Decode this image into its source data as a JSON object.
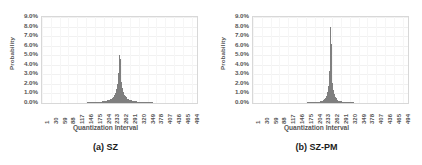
{
  "figure": {
    "panels": [
      {
        "caption": "(a) SZ",
        "xlabel": "Quantization Interval",
        "ylabel": "Probability"
      },
      {
        "caption": "(b) SZ-PM",
        "xlabel": "Quantization Interval",
        "ylabel": "Probability"
      }
    ]
  },
  "chart_data": [
    {
      "type": "bar",
      "title": "(a) SZ",
      "xlabel": "Quantization Interval",
      "ylabel": "Probability",
      "ylim": [
        0,
        9
      ],
      "ytick_labels": [
        "0.0%",
        "1.0%",
        "2.0%",
        "3.0%",
        "4.0%",
        "5.0%",
        "6.0%",
        "7.0%",
        "8.0%",
        "9.0%"
      ],
      "ytick_values": [
        0,
        1,
        2,
        3,
        4,
        5,
        6,
        7,
        8,
        9
      ],
      "xtick_labels": [
        "1",
        "30",
        "59",
        "88",
        "117",
        "146",
        "175",
        "204",
        "233",
        "262",
        "291",
        "320",
        "349",
        "378",
        "407",
        "436",
        "465",
        "494"
      ],
      "xtick_values": [
        1,
        30,
        59,
        88,
        117,
        146,
        175,
        204,
        233,
        262,
        291,
        320,
        349,
        378,
        407,
        436,
        465,
        494
      ],
      "xlim": [
        1,
        512
      ],
      "grid": true,
      "legend": "none",
      "bar_color": "#7f7f7f",
      "peak_x": 256,
      "peak_y": 5.0,
      "distribution": "laplacian",
      "categories": [
        1,
        17,
        33,
        49,
        65,
        81,
        97,
        113,
        129,
        145,
        161,
        177,
        193,
        209,
        225,
        233,
        241,
        245,
        249,
        251,
        253,
        254,
        255,
        256,
        257,
        258,
        259,
        261,
        263,
        267,
        271,
        279,
        287,
        303,
        319,
        335,
        351,
        367,
        383,
        399,
        415,
        431,
        447,
        463,
        479,
        495,
        511
      ],
      "values": [
        0.01,
        0.01,
        0.01,
        0.01,
        0.02,
        0.02,
        0.02,
        0.03,
        0.04,
        0.05,
        0.07,
        0.09,
        0.13,
        0.2,
        0.35,
        0.5,
        0.85,
        1.15,
        1.7,
        2.2,
        3.1,
        3.9,
        4.6,
        5.0,
        4.6,
        3.9,
        3.1,
        2.2,
        1.7,
        1.15,
        0.85,
        0.5,
        0.35,
        0.2,
        0.13,
        0.09,
        0.07,
        0.05,
        0.04,
        0.03,
        0.02,
        0.02,
        0.02,
        0.01,
        0.01,
        0.01,
        0.01
      ]
    },
    {
      "type": "bar",
      "title": "(b) SZ-PM",
      "xlabel": "Quantization Interval",
      "ylabel": "Probability",
      "ylim": [
        0,
        9
      ],
      "ytick_labels": [
        "0.0%",
        "1.0%",
        "2.0%",
        "3.0%",
        "4.0%",
        "5.0%",
        "6.0%",
        "7.0%",
        "8.0%",
        "9.0%"
      ],
      "ytick_values": [
        0,
        1,
        2,
        3,
        4,
        5,
        6,
        7,
        8,
        9
      ],
      "xtick_labels": [
        "1",
        "30",
        "59",
        "88",
        "117",
        "146",
        "175",
        "204",
        "233",
        "262",
        "291",
        "320",
        "349",
        "378",
        "407",
        "436",
        "465",
        "494"
      ],
      "xtick_values": [
        1,
        30,
        59,
        88,
        117,
        146,
        175,
        204,
        233,
        262,
        291,
        320,
        349,
        378,
        407,
        436,
        465,
        494
      ],
      "xlim": [
        1,
        512
      ],
      "grid": true,
      "legend": "none",
      "bar_color": "#7f7f7f",
      "peak_x": 256,
      "peak_y": 8.0,
      "distribution": "laplacian",
      "categories": [
        1,
        17,
        33,
        49,
        65,
        81,
        97,
        113,
        129,
        145,
        161,
        177,
        193,
        209,
        225,
        233,
        241,
        245,
        249,
        251,
        253,
        254,
        255,
        256,
        257,
        258,
        259,
        261,
        263,
        267,
        271,
        279,
        287,
        303,
        319,
        335,
        351,
        367,
        383,
        399,
        415,
        431,
        447,
        463,
        479,
        495,
        511
      ],
      "values": [
        0.005,
        0.005,
        0.005,
        0.01,
        0.01,
        0.01,
        0.01,
        0.015,
        0.02,
        0.025,
        0.035,
        0.05,
        0.07,
        0.1,
        0.18,
        0.28,
        0.6,
        0.9,
        1.5,
        2.1,
        3.4,
        4.6,
        6.2,
        8.0,
        6.2,
        4.6,
        3.4,
        2.1,
        1.5,
        0.9,
        0.6,
        0.28,
        0.18,
        0.1,
        0.07,
        0.05,
        0.035,
        0.025,
        0.02,
        0.015,
        0.01,
        0.01,
        0.01,
        0.005,
        0.005,
        0.005,
        0.005
      ]
    }
  ]
}
